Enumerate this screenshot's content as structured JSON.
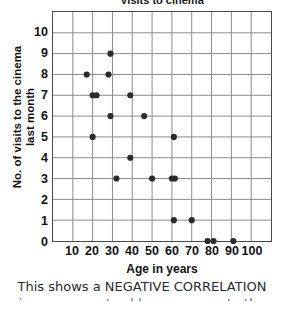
{
  "chart_data": {
    "type": "scatter",
    "title": "Visits to cinema",
    "xlabel": "Age in years",
    "ylabel": "No. of visits to the cinema last month",
    "ylabel_lines": [
      "No. of visits to the cinema",
      "last month"
    ],
    "xlim": [
      0,
      110
    ],
    "ylim": [
      0,
      11
    ],
    "xticks": [
      10,
      20,
      30,
      40,
      50,
      60,
      70,
      80,
      90,
      100
    ],
    "yticks": [
      0,
      1,
      2,
      3,
      4,
      5,
      6,
      7,
      8,
      9,
      10
    ],
    "x_minor_step": 10,
    "y_minor_step": 1,
    "grid": true,
    "legend": null,
    "marker": "filled-circle",
    "marker_color": "#2b2b2b",
    "grid_color": "#8c8c8c",
    "axis_color": "#4a4a4a",
    "points": [
      {
        "x": 29,
        "y": 9
      },
      {
        "x": 17,
        "y": 8
      },
      {
        "x": 28,
        "y": 8
      },
      {
        "x": 20,
        "y": 7
      },
      {
        "x": 22,
        "y": 7
      },
      {
        "x": 39,
        "y": 7
      },
      {
        "x": 29,
        "y": 6
      },
      {
        "x": 46,
        "y": 6
      },
      {
        "x": 20,
        "y": 5
      },
      {
        "x": 61,
        "y": 5
      },
      {
        "x": 39,
        "y": 4
      },
      {
        "x": 32,
        "y": 3
      },
      {
        "x": 50,
        "y": 3
      },
      {
        "x": 60,
        "y": 3
      },
      {
        "x": 61.5,
        "y": 3
      },
      {
        "x": 61,
        "y": 1
      },
      {
        "x": 70,
        "y": 1
      },
      {
        "x": 78,
        "y": 0
      },
      {
        "x": 81,
        "y": 0
      },
      {
        "x": 91,
        "y": 0
      }
    ]
  },
  "caption": {
    "line1": "This shows a NEGATIVE CORRELATION",
    "line2": "i.e. as one gets older, one goes to the cinema less"
  }
}
